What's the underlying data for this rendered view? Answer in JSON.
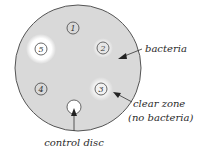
{
  "diagram": {
    "discs": [
      {
        "id": "1",
        "label": "1",
        "clear_zone": false
      },
      {
        "id": "2",
        "label": "2",
        "clear_zone": true,
        "zone_size": "small"
      },
      {
        "id": "3",
        "label": "3",
        "clear_zone": true,
        "zone_size": "medium"
      },
      {
        "id": "4",
        "label": "4",
        "clear_zone": false
      },
      {
        "id": "5",
        "label": "5",
        "clear_zone": true,
        "zone_size": "large"
      },
      {
        "id": "control",
        "label": "",
        "clear_zone": false
      }
    ],
    "annotations": {
      "bacteria": "bacteria",
      "clear_zone_line1": "clear zone",
      "clear_zone_line2": "(no bacteria)",
      "control_disc": "control disc"
    },
    "colors": {
      "plate_fill": "#d9d9d9",
      "plate_outline": "#555555",
      "clear_zone": "#ffffff",
      "text": "#2a2a2a"
    }
  }
}
